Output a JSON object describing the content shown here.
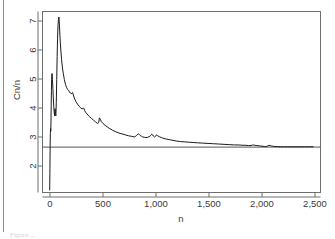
{
  "figure": {
    "caption_partial": "Figure ...",
    "background_color": "#ffffff",
    "line_color": "#1a1a1a",
    "axis_color": "#6e6e6e",
    "text_color": "#3a3a3a"
  },
  "chart_data": {
    "type": "line",
    "title": "",
    "xlabel": "n",
    "ylabel": "Cn/n",
    "xlim": [
      -60,
      2560
    ],
    "ylim": [
      1.62,
      7.52
    ],
    "grid": false,
    "legend": null,
    "xticks": [
      0,
      500,
      1000,
      1500,
      2000,
      2500
    ],
    "xticklabels": [
      "0",
      "500",
      "1,000",
      "1,500",
      "2,000",
      "2,500"
    ],
    "yticks": [
      2,
      3,
      4,
      5,
      6,
      7
    ],
    "yticklabels": [
      "2",
      "3",
      "4",
      "5",
      "6",
      "7"
    ],
    "series": [
      {
        "name": "Cn/n",
        "style": "solid",
        "x": [
          8,
          10,
          12,
          14,
          16,
          18,
          20,
          22,
          24,
          26,
          28,
          30,
          34,
          38,
          42,
          46,
          50,
          54,
          58,
          62,
          66,
          70,
          74,
          78,
          82,
          86,
          90,
          94,
          96,
          100,
          104,
          108,
          114,
          120,
          128,
          136,
          146,
          156,
          166,
          176,
          186,
          196,
          206,
          216,
          222,
          226,
          230,
          240,
          255,
          270,
          285,
          300,
          315,
          325,
          330,
          336,
          345,
          360,
          380,
          400,
          420,
          440,
          460,
          470,
          476,
          480,
          486,
          495,
          510,
          530,
          550,
          575,
          600,
          630,
          660,
          690,
          720,
          750,
          780,
          810,
          830,
          845,
          855,
          865,
          875,
          885,
          900,
          915,
          930,
          945,
          960,
          970,
          978,
          985,
          995,
          1005,
          1015,
          1025,
          1040,
          1060,
          1085,
          1110,
          1140,
          1170,
          1200,
          1240,
          1280,
          1320,
          1360,
          1400,
          1450,
          1500,
          1550,
          1600,
          1650,
          1700,
          1750,
          1790,
          1820,
          1850,
          1880,
          1905,
          1920,
          1940,
          1960,
          1985,
          2010,
          2030,
          2050,
          2065,
          2075,
          2085,
          2095,
          2110,
          2130,
          2155,
          2180,
          2210,
          2250,
          2290,
          2330,
          2370,
          2410,
          2450,
          2490
        ],
        "y": [
          1.7,
          2.4,
          3.1,
          3.55,
          3.7,
          3.62,
          3.95,
          4.45,
          4.95,
          5.3,
          5.45,
          5.5,
          5.3,
          5.0,
          4.7,
          4.42,
          4.25,
          4.12,
          4.35,
          4.2,
          4.12,
          4.55,
          5.3,
          6.05,
          6.65,
          7.05,
          7.25,
          7.34,
          7.3,
          7.05,
          6.75,
          6.5,
          6.2,
          5.95,
          5.68,
          5.5,
          5.3,
          5.15,
          5.05,
          4.98,
          4.95,
          4.88,
          4.86,
          4.84,
          4.88,
          4.86,
          4.8,
          4.7,
          4.58,
          4.5,
          4.43,
          4.38,
          4.34,
          4.38,
          4.36,
          4.3,
          4.24,
          4.18,
          4.1,
          4.04,
          3.98,
          3.92,
          3.87,
          3.9,
          4.05,
          4.04,
          4.0,
          3.93,
          3.87,
          3.81,
          3.76,
          3.7,
          3.65,
          3.6,
          3.56,
          3.53,
          3.5,
          3.47,
          3.45,
          3.43,
          3.5,
          3.53,
          3.5,
          3.47,
          3.45,
          3.43,
          3.42,
          3.41,
          3.42,
          3.44,
          3.48,
          3.52,
          3.5,
          3.46,
          3.43,
          3.45,
          3.5,
          3.47,
          3.44,
          3.41,
          3.38,
          3.36,
          3.34,
          3.32,
          3.3,
          3.28,
          3.27,
          3.26,
          3.25,
          3.24,
          3.23,
          3.22,
          3.21,
          3.2,
          3.19,
          3.18,
          3.17,
          3.17,
          3.16,
          3.16,
          3.15,
          3.15,
          3.17,
          3.16,
          3.15,
          3.14,
          3.13,
          3.12,
          3.12,
          3.14,
          3.16,
          3.15,
          3.14,
          3.13,
          3.12,
          3.12,
          3.11,
          3.11,
          3.11,
          3.11,
          3.11,
          3.11,
          3.11,
          3.11,
          3.11
        ]
      }
    ],
    "reference_lines": [
      {
        "name": "asymptote",
        "orientation": "horizontal",
        "value": 3.1
      }
    ]
  }
}
